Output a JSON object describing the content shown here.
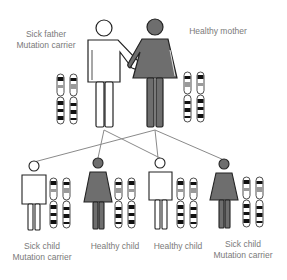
{
  "colors": {
    "sick_fill": "#ffffff",
    "healthy_fill": "#6e6e6e",
    "outline": "#222222",
    "line": "#8a8a8a",
    "band_dark": "#111111",
    "band_mid": "#9a9a9a",
    "label": "#7a7a7a"
  },
  "parents": {
    "father": {
      "line1": "Sick father",
      "line2": "Mutation carrier",
      "status": "sick"
    },
    "mother": {
      "line1": "Healthy mother",
      "status": "healthy"
    }
  },
  "children": [
    {
      "line1": "Sick child",
      "line2": "Mutation carrier",
      "sex": "male",
      "status": "sick"
    },
    {
      "line1": "Healthy child",
      "sex": "female",
      "status": "healthy"
    },
    {
      "line1": "Healthy child",
      "sex": "male",
      "status": "healthy"
    },
    {
      "line1": "Sick child",
      "line2": "Mutation carrier",
      "sex": "female",
      "status": "sick"
    }
  ],
  "inheritance_lines": [
    {
      "from": "father",
      "to": "child-2"
    },
    {
      "from": "father",
      "to": "child-3"
    },
    {
      "from": "mother",
      "to": "child-1"
    },
    {
      "from": "mother",
      "to": "child-3"
    },
    {
      "from": "mother",
      "to": "child-4"
    }
  ]
}
